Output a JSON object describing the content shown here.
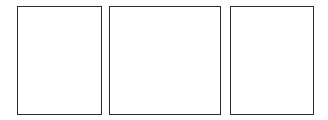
{
  "canvas": {
    "width": 328,
    "height": 120,
    "background": "#ffffff"
  },
  "panels": [
    {
      "id": "panel-1",
      "label": "",
      "border_color": "#2b2b2b",
      "fill": "#ffffff"
    },
    {
      "id": "panel-2",
      "label": "",
      "border_color": "#2b2b2b",
      "fill": "#ffffff"
    },
    {
      "id": "panel-3",
      "label": "",
      "border_color": "#2b2b2b",
      "fill": "#ffffff"
    }
  ]
}
